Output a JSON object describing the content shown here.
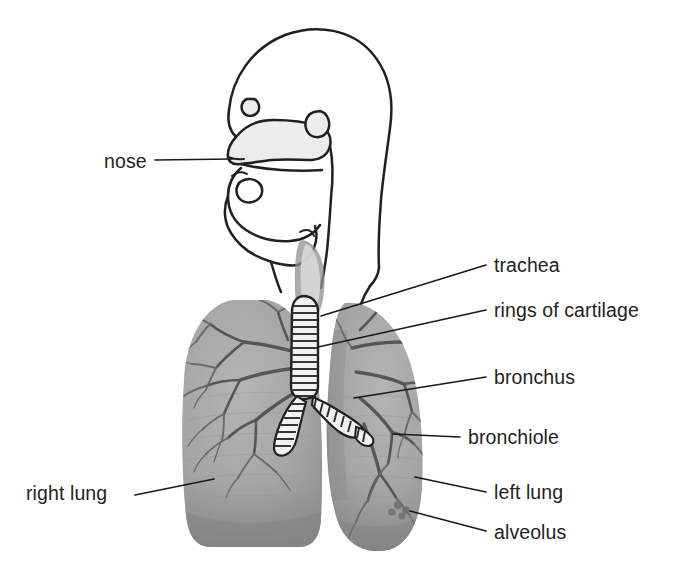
{
  "diagram": {
    "background_color": "#ffffff",
    "ink_color": "#231f20",
    "lung_fill_color": "#a8a8a8",
    "lung_shadow_color": "#8c8c8c",
    "cavity_fill_color": "#ececec",
    "bronchial_tree_color": "#6b6b6b",
    "labels": [
      {
        "id": "nose",
        "text": "nose",
        "text_x": 104,
        "text_y": 168,
        "anchor": "start",
        "leader": "M155,160 L232,159"
      },
      {
        "id": "trachea",
        "text": "trachea",
        "text_x": 494,
        "text_y": 272,
        "anchor": "start",
        "leader": "M321,316 L486,265"
      },
      {
        "id": "rings-of-cartilage",
        "text": "rings of cartilage",
        "text_x": 494,
        "text_y": 317,
        "anchor": "start",
        "leader": "M318,347 L486,310"
      },
      {
        "id": "bronchus",
        "text": "bronchus",
        "text_x": 494,
        "text_y": 384,
        "anchor": "start",
        "leader": "M354,398 L486,377"
      },
      {
        "id": "bronchiole",
        "text": "bronchiole",
        "text_x": 468,
        "text_y": 444,
        "anchor": "start",
        "leader": "M393,434 L460,437"
      },
      {
        "id": "right-lung",
        "text": "right lung",
        "text_x": 26,
        "text_y": 500,
        "anchor": "start",
        "leader": "M135,495 L214,479"
      },
      {
        "id": "left-lung",
        "text": "left lung",
        "text_x": 494,
        "text_y": 499,
        "anchor": "start",
        "leader": "M415,477 L486,492"
      },
      {
        "id": "alveolus",
        "text": "alveolus",
        "text_x": 494,
        "text_y": 539,
        "anchor": "start",
        "leader": "M410,511 L486,531"
      }
    ],
    "structures": {
      "head_profile": "side view of human head showing nasal cavity, mouth, tongue and throat",
      "trachea_rings_count": 14,
      "right_bronchus_rings_count": 6,
      "left_bronchus_rings_count": 7,
      "lungs": [
        "right lung",
        "left lung"
      ]
    }
  }
}
